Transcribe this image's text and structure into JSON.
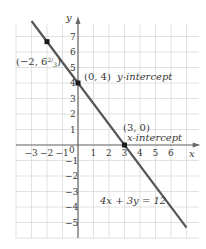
{
  "chart_data": {
    "type": "line",
    "title": "",
    "xlabel": "x",
    "ylabel": "y",
    "xlim": [
      -4,
      8
    ],
    "ylim": [
      -6,
      8
    ],
    "grid": true,
    "x_ticks": [
      "-3",
      "-2",
      "-1",
      "0",
      "1",
      "2",
      "3",
      "4",
      "5",
      "6"
    ],
    "y_ticks": [
      "7",
      "6",
      "5",
      "4",
      "3",
      "2",
      "1",
      "-1",
      "-2",
      "-3",
      "-4",
      "-5"
    ],
    "series": [
      {
        "name": "4x + 3y = 12",
        "equation": "4x + 3y = 12",
        "x": [
          -3,
          7
        ],
        "y": [
          8,
          -5.333
        ],
        "color": "#555555"
      }
    ],
    "points": [
      {
        "x": -2,
        "y": 6.667,
        "label": "(-2, 6 2/3)"
      },
      {
        "x": 0,
        "y": 4,
        "label": "(0, 4)",
        "annotation": "y-intercept"
      },
      {
        "x": 3,
        "y": 0,
        "label": "(3, 0)",
        "annotation": "x-intercept"
      }
    ],
    "annotations": [
      "(−2, 6⅔)",
      "(0, 4) y-intercept",
      "(3, 0)",
      "x-intercept",
      "4x + 3y = 12"
    ]
  },
  "labels": {
    "x_axis": "x",
    "y_axis": "y",
    "origin": "0",
    "point1_text": "(−2, 6",
    "point1_frac_num": "2",
    "point1_frac_den": "3",
    "point1_close": ")",
    "point2_text": "(0, 4)",
    "point2_annot": "y-intercept",
    "point3_text": "(3, 0)",
    "point3_annot": "x-intercept",
    "equation": "4x + 3y = 12"
  },
  "colors": {
    "grid": "#d9d9d9",
    "axis": "#6a6a6a",
    "line": "#555555",
    "point": "#1a1a1a"
  }
}
